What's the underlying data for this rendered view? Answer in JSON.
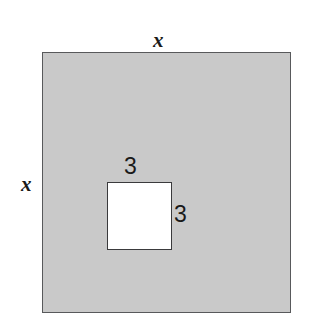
{
  "figure": {
    "type": "geometry-diagram",
    "background_color": "#ffffff",
    "outer_square": {
      "name": "large-shaded-square",
      "fill_color": "#c9c9c9",
      "stroke_color": "#58595b",
      "side_label_top": "x",
      "side_label_left": "x"
    },
    "inner_square": {
      "name": "small-white-square",
      "fill_color": "#ffffff",
      "stroke_color": "#3a3a3c",
      "side_label_top": "3",
      "side_label_right": "3"
    }
  }
}
